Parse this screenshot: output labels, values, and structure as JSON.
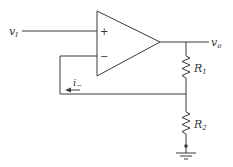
{
  "diagram": {
    "type": "non-inverting op-amp circuit",
    "labels": {
      "input": "v",
      "input_sub": "I",
      "output": "v",
      "output_sub": "o",
      "plus": "+",
      "minus": "−",
      "current": "i",
      "current_sub": "−",
      "r1": "R",
      "r1_sub": "1",
      "r2": "R",
      "r2_sub": "2"
    },
    "components": [
      {
        "id": "opamp",
        "kind": "op-amp"
      },
      {
        "id": "R1",
        "kind": "resistor",
        "between": [
          "output node",
          "feedback node"
        ]
      },
      {
        "id": "R2",
        "kind": "resistor",
        "between": [
          "feedback node",
          "ground"
        ]
      },
      {
        "id": "ground",
        "kind": "ground"
      }
    ],
    "colors": {
      "line": "#3a3a3a",
      "text": "#333333",
      "background": "#ffffff"
    }
  }
}
